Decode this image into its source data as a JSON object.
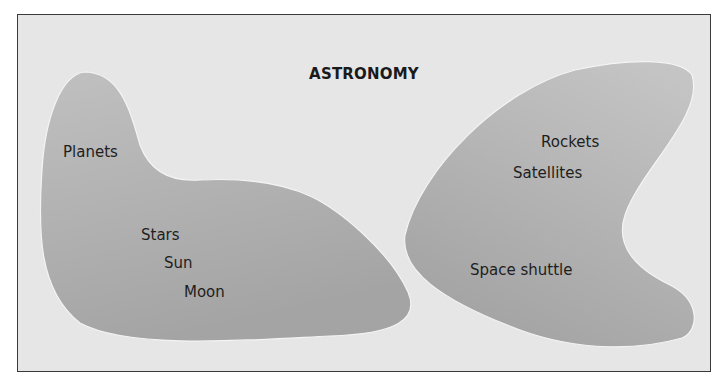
{
  "diagram": {
    "title": "ASTRONOMY",
    "colors": {
      "background": "#e6e6e6",
      "frame_border": "#3a3a3a",
      "region_fill_top": "#bdbdbd",
      "region_fill_bottom": "#a2a2a2",
      "region_highlight": "#f7f7f7",
      "text": "#1e1e1e"
    },
    "regions": [
      {
        "name": "left-region",
        "labels": [
          "Planets",
          "Stars",
          "Sun",
          "Moon"
        ]
      },
      {
        "name": "right-region",
        "labels": [
          "Rockets",
          "Satellites",
          "Space shuttle"
        ]
      }
    ]
  }
}
